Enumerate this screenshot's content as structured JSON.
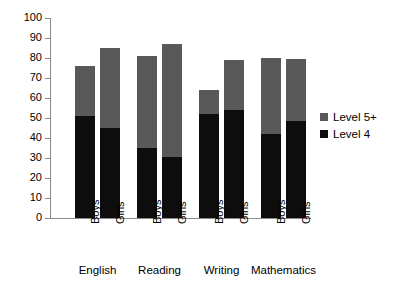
{
  "chart_data": {
    "type": "bar",
    "subtype": "stacked-bar-grouped",
    "title": "",
    "xlabel": "",
    "ylabel": "",
    "ylim": [
      0,
      100
    ],
    "y_ticks": [
      0,
      10,
      20,
      30,
      40,
      50,
      60,
      70,
      80,
      90,
      100
    ],
    "grid": false,
    "legend_position": "right",
    "groups": [
      "English",
      "Reading",
      "Writing",
      "Mathematics"
    ],
    "categories": [
      "English Boys",
      "English Girls",
      "Reading Boys",
      "Reading Girls",
      "Writing Boys",
      "Writing Girls",
      "Mathematics Boys",
      "Mathematics Girls"
    ],
    "sub_categories": [
      "Boys",
      "Girls",
      "Boys",
      "Girls",
      "Boys",
      "Girls",
      "Boys",
      "Girls"
    ],
    "series": [
      {
        "name": "Level 4",
        "color": "#0d0d0d",
        "values": [
          51,
          45,
          35,
          30.5,
          52,
          54,
          42,
          48.5
        ]
      },
      {
        "name": "Level 5+",
        "color": "#595959",
        "values": [
          25,
          40,
          46,
          56.5,
          12,
          25,
          38,
          31
        ]
      }
    ],
    "totals": [
      76,
      85,
      81,
      87,
      64,
      79,
      80,
      79.5
    ]
  },
  "axis": {
    "y_tick_labels": [
      "100",
      "90",
      "80",
      "70",
      "60",
      "50",
      "40",
      "30",
      "20",
      "10",
      "0"
    ]
  },
  "legend": {
    "items": [
      {
        "label": "Level 5+",
        "color": "#595959"
      },
      {
        "label": "Level 4",
        "color": "#0d0d0d"
      }
    ]
  },
  "x_axis": {
    "sub_labels": [
      "Boys",
      "Girls",
      "Boys",
      "Girls",
      "Boys",
      "Girls",
      "Boys",
      "Girls"
    ],
    "group_labels": [
      "English",
      "Reading",
      "Writing",
      "Mathematics"
    ]
  },
  "colors": {
    "level4": "#0d0d0d",
    "level5plus": "#595959",
    "axis": "#8c8c8c",
    "background": "#ffffff"
  }
}
